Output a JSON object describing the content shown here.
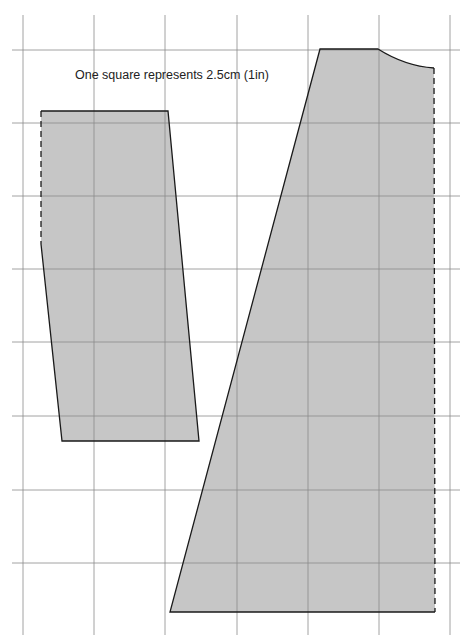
{
  "diagram": {
    "caption": "One square represents 2.5cm (1in)",
    "colors": {
      "grid": "#8a8a8a",
      "fill": "#c6c6c6",
      "outline": "#1a1a1a",
      "background": "#ffffff"
    },
    "grid": {
      "x_lines": [
        23,
        94,
        165,
        237,
        308,
        379,
        450
      ],
      "y_lines": [
        50,
        123,
        196,
        269,
        342,
        416,
        490,
        563
      ],
      "x_extent": [
        12,
        460
      ],
      "y_extent": [
        15,
        635
      ]
    },
    "pieces": [
      {
        "name": "small-pattern-piece",
        "fill_polygon": "41,111 168,111 199,441 62,441 41,244",
        "solid_outline": "41,244 62,441 199,441 168,111 41,111",
        "dashed_edge": "41,111 41,244"
      },
      {
        "name": "large-pattern-piece",
        "fill_path": "M320,49 L378,49 Q405,66 434,68 L435,612 L170,612 Z",
        "solid_outline": "M434,68 Q405,66 378,49 L320,49 L170,612 L435,612",
        "dashed_edge": "M434,68 L435,612"
      }
    ]
  }
}
